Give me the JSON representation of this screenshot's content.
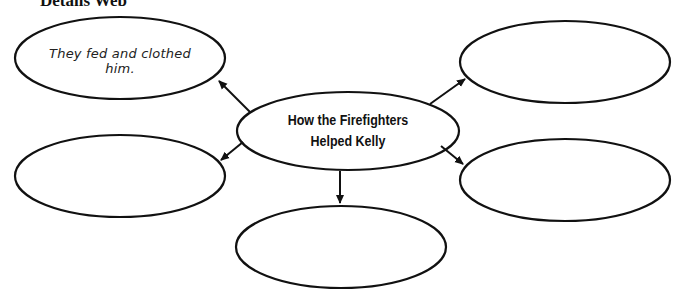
{
  "page": {
    "title": "Details Web"
  },
  "web": {
    "center": {
      "label_line1": "How the Firefighters",
      "label_line2": "Helped Kelly"
    },
    "details": [
      {
        "position": "top-left",
        "text": "They fed and clothed him."
      },
      {
        "position": "top-right",
        "text": ""
      },
      {
        "position": "middle-left",
        "text": ""
      },
      {
        "position": "middle-right",
        "text": ""
      },
      {
        "position": "bottom",
        "text": ""
      }
    ]
  },
  "colors": {
    "stroke": "#111111",
    "background": "#ffffff"
  }
}
